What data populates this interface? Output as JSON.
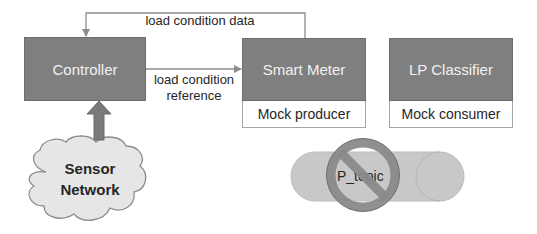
{
  "diagram": {
    "nodes": {
      "controller": {
        "label": "Controller"
      },
      "smart_meter": {
        "label": "Smart Meter",
        "sublabel": "Mock producer"
      },
      "lp_classifier": {
        "label": "LP Classifier",
        "sublabel": "Mock consumer"
      },
      "sensor_network": {
        "line1": "Sensor",
        "line2": "Network"
      },
      "topic": {
        "label": "P_topic",
        "status": "disabled",
        "overlay_icon": "prohibited-icon"
      }
    },
    "edges": {
      "load_condition_data": {
        "label": "load condition data",
        "from": "Smart Meter",
        "to": "Controller"
      },
      "load_condition_reference": {
        "line1": "load condition",
        "line2": "reference",
        "from": "Controller",
        "to": "Smart Meter"
      },
      "sensor_input": {
        "from": "Sensor Network",
        "to": "Controller"
      }
    },
    "colors": {
      "node_fill": "#7f7f7f",
      "node_text": "#f2f2f2",
      "sub_box_fill": "#ffffff",
      "connector": "#8c8c8c",
      "cloud_fill": "#e6e6e6",
      "pill_fill": "#c8c8c8",
      "prohibit_ring": "#8a8a8a"
    }
  }
}
